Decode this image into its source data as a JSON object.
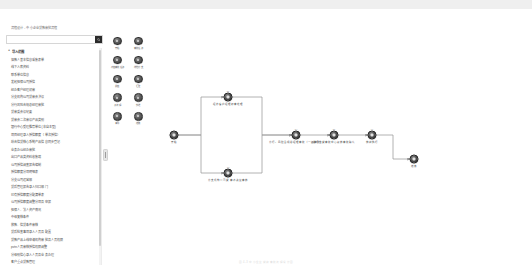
{
  "header": {
    "breadcrumb": "流程设计 - 中小企业贷款审批流程"
  },
  "toolbar": {
    "buttons": [
      {
        "label": "保存并发布",
        "name": "publish-button"
      },
      {
        "label": "保 存",
        "name": "save-button"
      },
      {
        "label": "取 消",
        "name": "cancel-button"
      }
    ]
  },
  "search": {
    "value": "",
    "placeholder": "",
    "icon": "search-icon"
  },
  "tree": {
    "group_caret": "∧",
    "group_title": "导入范围",
    "items": [
      "借款人基本信息采集表单",
      "线下入库资料",
      "联系单位信息",
      "发起担保公司授信",
      "经办客户经理初审",
      "分支机构公司贷审会决议",
      "分行风险合规总经理审批",
      "贷审委会议纪要",
      "贷审会二次审议产品类别",
      "银行中心受理推荐单位(非自主型)",
      "项目经理录入授信额度（单次授信）",
      "综合信贷核心系统产品信息同步登记",
      "业务办公经办审批",
      "出口产品类资料收集端",
      "公司授信调查报告编制",
      "授信额度分项明细表",
      "分支公司运营部",
      "贷后管理报告录入归口部门",
      "已有授信额度分配清单表",
      "公司授信额度调整分项及申报",
      "担保人、法人资产情况",
      "中级复核条件",
      "放款、信贷条件审核",
      "贷后检查事项录入人员及配置",
      "贷款产品上线申请机构审批及人员权限",
      "pvtn人员审核授信权限调整",
      "分级别信心录入人员及业务办理",
      "客户重点贷款管理"
    ]
  },
  "palette": {
    "items": [
      {
        "label": "开始",
        "name": "palette-start"
      },
      {
        "label": "审批任务",
        "name": "palette-approval-task"
      },
      {
        "label": "会签审批任务",
        "name": "palette-countersign-task"
      },
      {
        "label": "排他分支",
        "name": "palette-exclusive-gateway"
      },
      {
        "label": "并签",
        "name": "palette-parallel-join"
      },
      {
        "label": "汇聚",
        "name": "palette-converge"
      },
      {
        "label": "子流程",
        "name": "palette-subprocess"
      },
      {
        "label": "抄送",
        "name": "palette-carbon-copy"
      },
      {
        "label": "事件",
        "name": "palette-event"
      },
      {
        "label": "结束",
        "name": "palette-end"
      }
    ]
  },
  "flow": {
    "nodes": [
      {
        "id": "n1",
        "code": "",
        "label": "开始",
        "x": 24,
        "y": 100
      },
      {
        "id": "n2",
        "code": "B2",
        "label": "经办客户经理初审处理",
        "x": 78,
        "y": 62
      },
      {
        "id": "n3",
        "code": "C3",
        "label": "分支机构公司贷审会决议审核",
        "x": 78,
        "y": 138
      },
      {
        "id": "n4",
        "code": "D4",
        "label": "分行、风险合规总经理审批（一级审批）",
        "x": 146,
        "y": 100
      },
      {
        "id": "n5",
        "code": "E5",
        "label": "总行信贷审批中心复核审批确认",
        "x": 184,
        "y": 100
      },
      {
        "id": "n6",
        "code": "F6",
        "label": "放款执行",
        "x": 222,
        "y": 100
      },
      {
        "id": "n7",
        "code": "",
        "label": "结束",
        "x": 264,
        "y": 124
      }
    ],
    "edges": [
      {
        "from": "n1",
        "to": "n2"
      },
      {
        "from": "n1",
        "to": "n3"
      },
      {
        "from": "n2",
        "to": "n4"
      },
      {
        "from": "n3",
        "to": "n4"
      },
      {
        "from": "n4",
        "to": "n5"
      },
      {
        "from": "n5",
        "to": "n6"
      },
      {
        "from": "n6",
        "to": "n7"
      }
    ]
  },
  "footer": {
    "text": "图 4-3 中小企业贷款审批流程设计图"
  },
  "colors": {
    "node_fill": "#4f4f4f",
    "button_bg": "#1f1f1f",
    "edge": "#9a9a9a",
    "panel_border": "#d6d6d6"
  }
}
